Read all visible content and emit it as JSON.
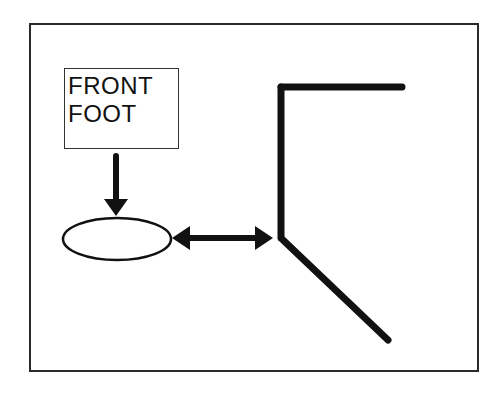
{
  "diagram": {
    "label": {
      "lines": [
        "FRONT",
        "FOOT"
      ]
    },
    "shapes": {
      "foot": "ellipse",
      "body": "angled-line-figure"
    },
    "colors": {
      "stroke": "#111111",
      "background": "#ffffff",
      "frame": "#2a2a2a"
    }
  }
}
